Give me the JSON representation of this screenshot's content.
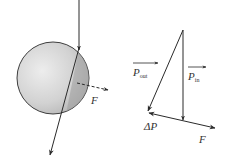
{
  "diagram": {
    "colors": {
      "stroke": "#2a2a2a",
      "sphere_light": "#e6e6e6",
      "sphere_dark": "#a8a8a8",
      "label": "#333333"
    },
    "left_panel": {
      "force_label": "F"
    },
    "right_panel": {
      "p_out_label": "P",
      "p_out_sub": "out",
      "p_in_label": "P",
      "p_in_sub": "in",
      "delta_p_label": "ΔP",
      "force_label": "F"
    }
  }
}
